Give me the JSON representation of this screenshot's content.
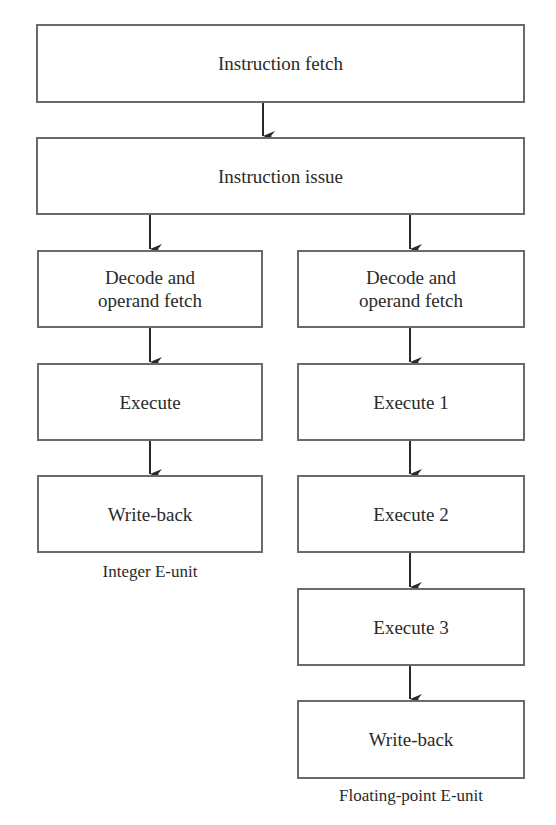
{
  "diagram": {
    "top": {
      "fetch": "Instruction fetch",
      "issue": "Instruction issue"
    },
    "integer_unit": {
      "caption": "Integer E-unit",
      "stages": [
        "Decode and\noperand fetch",
        "Execute",
        "Write-back"
      ]
    },
    "fp_unit": {
      "caption": "Floating-point E-unit",
      "stages": [
        "Decode and\noperand fetch",
        "Execute 1",
        "Execute 2",
        "Execute 3",
        "Write-back"
      ]
    }
  }
}
